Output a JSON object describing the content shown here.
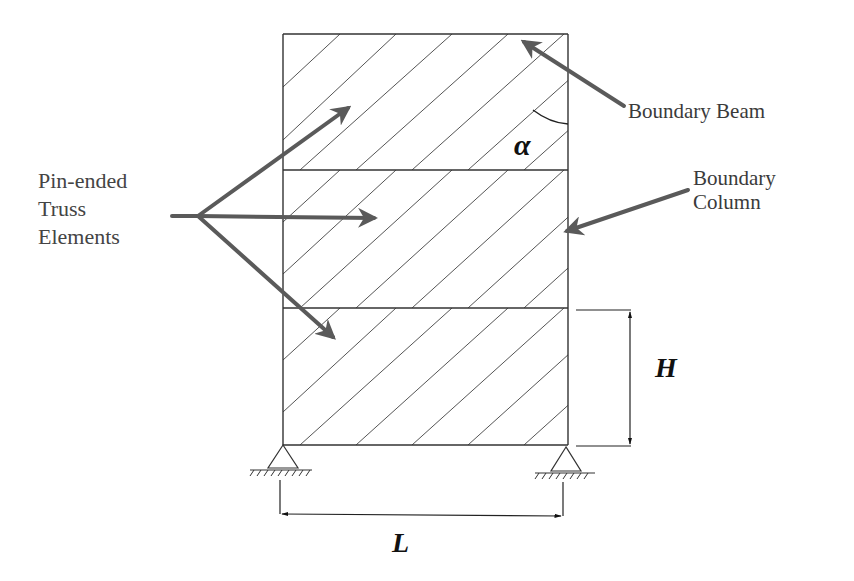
{
  "diagram": {
    "type": "braced-frame-truss-model",
    "stories": 3,
    "labels": {
      "truss_elements": [
        "Pin-ended",
        "Truss",
        "Elements"
      ],
      "boundary_beam": "Boundary Beam",
      "boundary_column": [
        "Boundary",
        "Column"
      ]
    },
    "symbols": {
      "angle": "α",
      "height": "H",
      "length": "L"
    },
    "colors": {
      "frame": "#333333",
      "hatch": "#555555",
      "arrow": "#5a5a5a",
      "text": "#3a3a3a",
      "symbol": "#111111"
    },
    "geometry": {
      "frame_left": 283,
      "frame_right": 568,
      "floor_levels": [
        34,
        170,
        308,
        445
      ]
    }
  }
}
